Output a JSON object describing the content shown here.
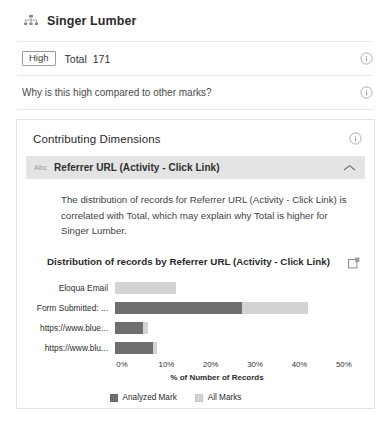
{
  "header": {
    "title": "Singer Lumber",
    "icon": "hierarchy-icon"
  },
  "summary_row": {
    "badge": "High",
    "measure_label": "Total",
    "measure_value": "171",
    "info_icon": "info-icon"
  },
  "question_row": {
    "text": "Why is this high compared to other marks?",
    "info_icon": "info-icon"
  },
  "card": {
    "title": "Contributing Dimensions",
    "info_icon": "info-icon",
    "accordion": {
      "icon": "abc-text-dimension-icon",
      "title": "Referrer URL (Activity - Click Link)",
      "chevron": "chevron-up-icon",
      "expanded": true
    },
    "narrative": "The distribution of records for Referrer URL (Activity - Click Link) is correlated with Total, which may explain why Total is higher for Singer Lumber.",
    "chart_header": {
      "title": "Distribution of records by Referrer URL (Activity - Click Link)",
      "export_icon": "open-in-new-window-icon"
    }
  },
  "colors": {
    "analyzed_mark": "#6f6f6f",
    "all_marks": "#d3d3d3",
    "accordion_bg": "#e4e4e4",
    "border": "#e3e3e3",
    "text": "#333333"
  },
  "chart_data": {
    "type": "bar",
    "orientation": "horizontal",
    "title": "Distribution of records by Referrer URL (Activity - Click Link)",
    "xlabel": "% of Number of Records",
    "ylabel": "",
    "xlim": [
      0,
      55
    ],
    "xticks": [
      0,
      10,
      20,
      30,
      40,
      50
    ],
    "xticklabels": [
      "0%",
      "10%",
      "20%",
      "30%",
      "40%",
      "50%"
    ],
    "grid": false,
    "legend_position": "bottom",
    "categories": [
      "Eloqua Email",
      "Form Submitted: ...",
      "https://www.blue...",
      "https://www.blu..."
    ],
    "series": [
      {
        "name": "Analyzed Mark",
        "color": "#6f6f6f",
        "values": [
          0,
          27,
          6,
          8
        ]
      },
      {
        "name": "All Marks",
        "color": "#d3d3d3",
        "values": [
          13,
          41,
          7,
          9
        ]
      }
    ]
  }
}
